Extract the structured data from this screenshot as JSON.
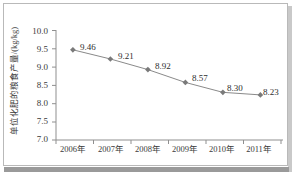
{
  "chart_data": {
    "type": "line",
    "title": "",
    "subtitle": "",
    "xlabel": "",
    "ylabel": "单位化肥的粮食产量/(kg/kg)",
    "categories": [
      "2006年",
      "2007年",
      "2008年",
      "2009年",
      "2010年",
      "2011年"
    ],
    "x": [
      "2006年",
      "2007年",
      "2008年",
      "2009年",
      "2010年",
      "2011年"
    ],
    "values": [
      9.46,
      9.21,
      8.92,
      8.57,
      8.3,
      8.23
    ],
    "point_labels": [
      "9.46",
      "9.21",
      "8.92",
      "8.57",
      "8.30",
      "8.23"
    ],
    "series": [
      {
        "name": "单位化肥的粮食产量",
        "values": [
          9.46,
          9.21,
          8.92,
          8.57,
          8.3,
          8.23
        ],
        "color": "#808080",
        "marker": "diamond"
      }
    ],
    "ylim": [
      7.0,
      10.0
    ],
    "yticks": [
      "7.0",
      "7.5",
      "8.0",
      "8.5",
      "9.0",
      "9.5",
      "10.0"
    ],
    "ytick_values": [
      7.0,
      7.5,
      8.0,
      8.5,
      9.0,
      9.5,
      10.0
    ],
    "grid": false,
    "legend": false,
    "legend_position": "none",
    "line_color": "#8a8a8a",
    "marker_color": "#7a7a7a",
    "axis_color": "#8f8f8f",
    "text_color": "#3a3a3a",
    "frame_color": "#b9b9b9",
    "background": "#ffffff"
  }
}
